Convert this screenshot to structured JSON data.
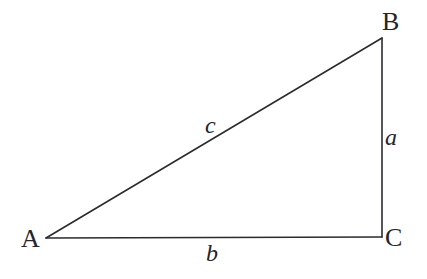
{
  "figure": {
    "kind": "right-triangle-diagram",
    "width": 427,
    "height": 279,
    "background_color": "#ffffff",
    "stroke_color": "#2b2b30",
    "stroke_width": 1.6
  },
  "vertices": {
    "A": {
      "label": "A",
      "x": 46,
      "y": 238
    },
    "B": {
      "label": "B",
      "x": 382,
      "y": 38
    },
    "C": {
      "label": "C",
      "x": 382,
      "y": 237
    }
  },
  "sides": {
    "a": {
      "label": "a",
      "from": "B",
      "to": "C",
      "description": "vertical-leg"
    },
    "b": {
      "label": "b",
      "from": "A",
      "to": "C",
      "description": "horizontal-leg"
    },
    "c": {
      "label": "c",
      "from": "A",
      "to": "B",
      "description": "hypotenuse"
    }
  },
  "geometry": {
    "hypotenuse_path": "M 46 238 L 382 38",
    "vertical_leg_path": "M 382 38 L 382 237",
    "horizontal_leg_path": "M 46 238 L 382 237"
  }
}
